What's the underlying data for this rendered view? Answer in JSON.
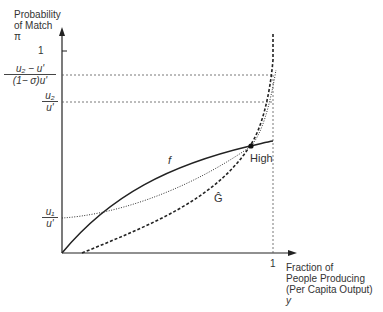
{
  "y_axis": {
    "label_lines": [
      "Probability",
      "of Match",
      "π"
    ],
    "tick_one": "1",
    "ticks": [
      {
        "id": "u2_minus_u_over",
        "numerator": "u₂ − u'",
        "denominator": "(1− σ)u'"
      },
      {
        "id": "u2_over",
        "numerator": "u₂",
        "denominator": "u'"
      },
      {
        "id": "u1_over",
        "numerator": "u₁",
        "denominator": "u'"
      }
    ]
  },
  "x_axis": {
    "label_lines": [
      "Fraction of",
      "People Producing",
      "(Per Capita Output)",
      "y"
    ],
    "tick_one": "1"
  },
  "curves": {
    "f_label": "f",
    "g_label": "Ĝ",
    "point_label": "High"
  },
  "colors": {
    "line": "#222222",
    "guide": "#555555"
  }
}
